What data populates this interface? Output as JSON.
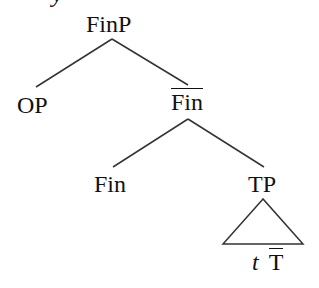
{
  "cropped_text_fragment": "y",
  "tree": {
    "root": {
      "label": "FinP"
    },
    "level1": {
      "left": {
        "label": "OP"
      },
      "right": {
        "label": "Fin",
        "bar": true
      }
    },
    "level2": {
      "left": {
        "label": "Fin"
      },
      "right": {
        "label": "TP"
      }
    },
    "triangle": {
      "under": "TP",
      "content": {
        "trace": "t",
        "bar_label": "T",
        "bar": true
      }
    }
  },
  "colors": {
    "ink": "#111111",
    "background": "#ffffff"
  }
}
